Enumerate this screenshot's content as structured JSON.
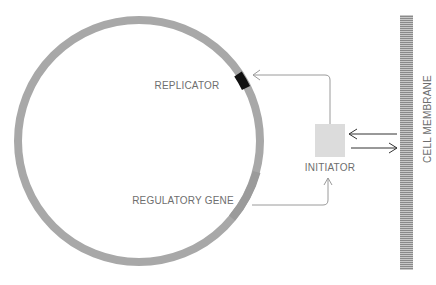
{
  "diagram": {
    "labels": {
      "replicator": "REPLICATOR",
      "regulatory_gene": "REGULATORY GENE",
      "initiator": "INITIATOR",
      "cell_membrane": "CELL MEMBRANE"
    },
    "colors": {
      "chromosome": "#a8a8a8",
      "regulatory_segment": "#999999",
      "replicator": "#111111",
      "initiator": "#dddddd",
      "arrow_gray": "#9a9a9a",
      "arrow_dark": "#333333",
      "membrane": "#8f8f8f"
    }
  }
}
